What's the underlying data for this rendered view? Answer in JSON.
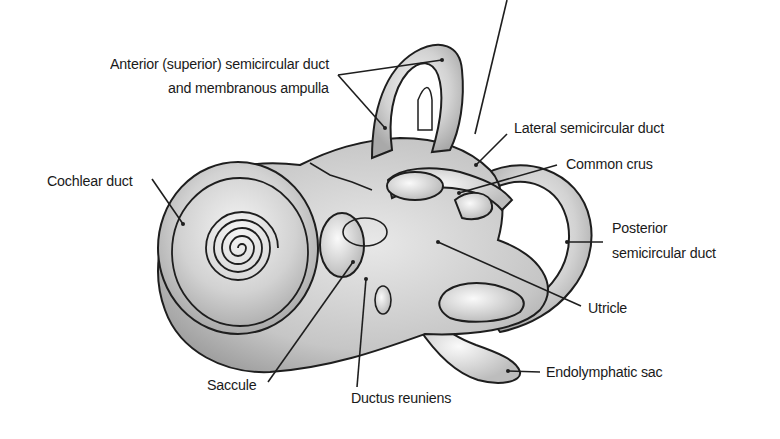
{
  "diagram": {
    "labels": [
      {
        "id": "anterior",
        "lines": [
          "Anterior (superior) semicircular duct",
          "and membranous ampulla"
        ]
      },
      {
        "id": "lateral",
        "lines": [
          "Lateral semicircular duct"
        ]
      },
      {
        "id": "common-crus",
        "lines": [
          "Common crus"
        ]
      },
      {
        "id": "cochlear",
        "lines": [
          "Cochlear duct"
        ]
      },
      {
        "id": "posterior",
        "lines": [
          "Posterior",
          "semicircular duct"
        ]
      },
      {
        "id": "utricle",
        "lines": [
          "Utricle"
        ]
      },
      {
        "id": "endolymphatic",
        "lines": [
          "Endolymphatic sac"
        ]
      },
      {
        "id": "saccule",
        "lines": [
          "Saccule"
        ]
      },
      {
        "id": "ductus",
        "lines": [
          "Ductus reuniens"
        ]
      }
    ],
    "colors": {
      "background": "#ffffff",
      "outline": "#1e1e1e",
      "fill": "#d4d4d4",
      "text": "#1a1a1a"
    }
  }
}
